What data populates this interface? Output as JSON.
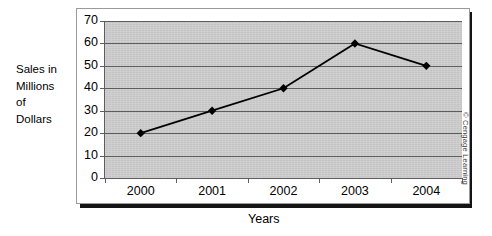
{
  "chart_data": {
    "type": "line",
    "title": "",
    "xlabel": "Years",
    "ylabel": "Sales in Millions of Dollars",
    "categories": [
      "2000",
      "2001",
      "2002",
      "2003",
      "2004"
    ],
    "values": [
      20,
      30,
      40,
      60,
      50
    ],
    "series": [
      {
        "name": "Sales",
        "values": [
          20,
          30,
          40,
          60,
          50
        ]
      }
    ],
    "ylim": [
      0,
      70
    ],
    "ytick_step": 10,
    "yticks": [
      70,
      60,
      50,
      40,
      30,
      20,
      10,
      0
    ],
    "grid": "horizontal",
    "legend": "none",
    "marker": "diamond",
    "line_color": "#000000",
    "marker_color": "#000000",
    "plot_background": "#cfcfcf",
    "gridline_color": "#5d5d5d"
  },
  "y_axis_caption": {
    "line1": "Sales in",
    "line2": "Millions",
    "line3": "of",
    "line4": "Dollars"
  },
  "x_axis_title": "Years",
  "credit": "© Cengage Learning"
}
